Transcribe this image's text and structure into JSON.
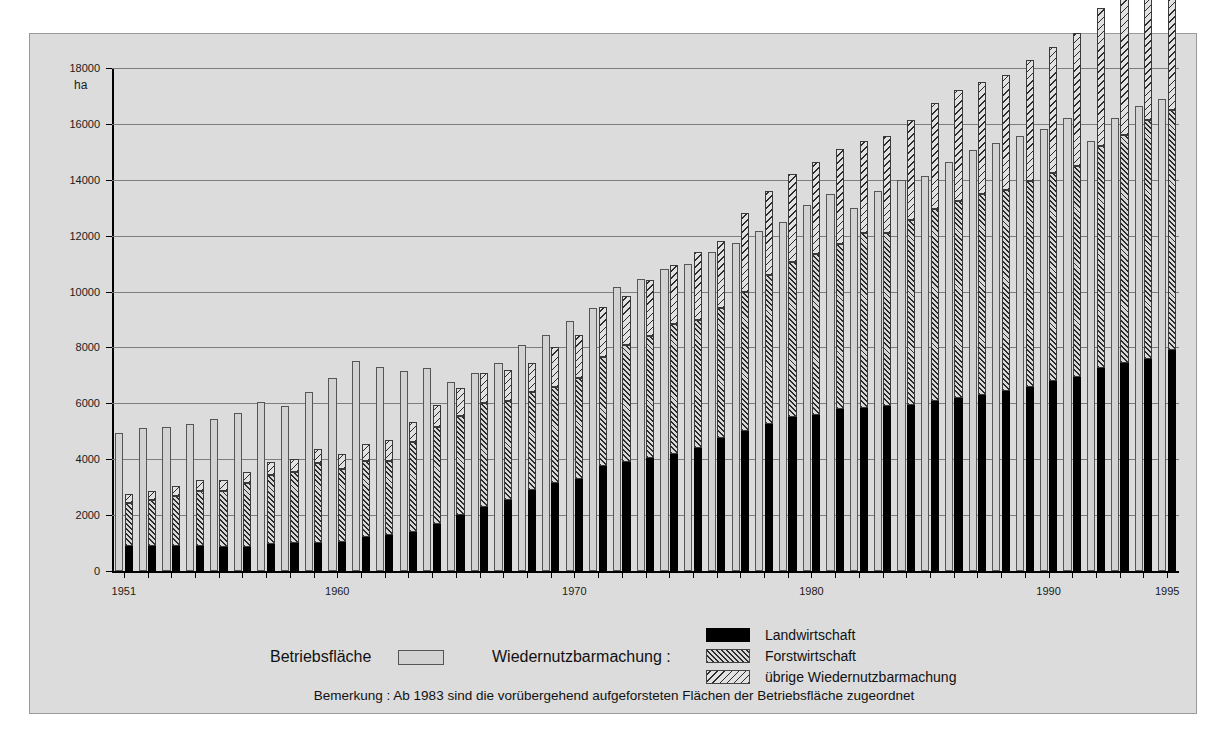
{
  "panel": {
    "y_axis_unit": "ha",
    "note": "Bemerkung : Ab  1983  sind die vorübergehend aufgeforsteten Flächen der Betriebsfläche zugeordnet"
  },
  "legend": {
    "betriebsflaeche_label": "Betriebsfläche",
    "wiedernutzbarmachung_label": "Wiedernutzbarmachung :",
    "items": [
      {
        "label": "Landwirtschaft",
        "pattern": "solid-black",
        "color": "#000000"
      },
      {
        "label": "Forstwirtschaft",
        "pattern": "dense-diagonal-hatch",
        "color": "#2b2b2b"
      },
      {
        "label": "übrige Wiedernutzbarmachung",
        "pattern": "sparse-reverse-diagonal-hatch",
        "color": "#2b2b2b"
      }
    ]
  },
  "chart_data": {
    "type": "bar",
    "title": "",
    "subtitle": "",
    "xlabel": "",
    "ylabel": "ha",
    "ylim": [
      0,
      18000
    ],
    "ytick_values": [
      0,
      2000,
      4000,
      6000,
      8000,
      10000,
      12000,
      14000,
      16000,
      18000
    ],
    "ytick_labels": [
      "0",
      "2000",
      "4000",
      "6000",
      "8000",
      "10000",
      "12000",
      "14000",
      "16000",
      "18000"
    ],
    "grid": true,
    "legend_position": "bottom",
    "xtick_labels": [
      "1951",
      "1960",
      "1970",
      "1980",
      "1990",
      "1995"
    ],
    "xtick_years": [
      1951,
      1960,
      1970,
      1980,
      1990,
      1995
    ],
    "categories": [
      1951,
      1952,
      1953,
      1954,
      1955,
      1956,
      1957,
      1958,
      1959,
      1960,
      1961,
      1962,
      1963,
      1964,
      1965,
      1966,
      1967,
      1968,
      1969,
      1970,
      1971,
      1972,
      1973,
      1974,
      1975,
      1976,
      1977,
      1978,
      1979,
      1980,
      1981,
      1982,
      1983,
      1984,
      1985,
      1986,
      1987,
      1988,
      1989,
      1990,
      1991,
      1992,
      1993,
      1994,
      1995
    ],
    "series": [
      {
        "name": "Betriebsfläche",
        "stack": "betrieb",
        "pattern": "outline-light",
        "values": [
          4950,
          5100,
          5150,
          5250,
          5450,
          5650,
          6050,
          5900,
          6400,
          6900,
          7500,
          7300,
          7150,
          7250,
          6750,
          7100,
          7450,
          8100,
          8450,
          8950,
          9400,
          10150,
          10450,
          10800,
          11000,
          11400,
          11750,
          12150,
          12500,
          13100,
          13500,
          13000,
          13600,
          14000,
          14150,
          14650,
          15050,
          15300,
          15550,
          15800,
          16200,
          15400,
          16200,
          16650,
          16900
        ]
      },
      {
        "name": "Landwirtschaft",
        "stack": "wieder",
        "pattern": "solid-black",
        "values": [
          900,
          900,
          900,
          900,
          850,
          850,
          950,
          1000,
          1000,
          1050,
          1200,
          1300,
          1400,
          1700,
          2000,
          2300,
          2550,
          2900,
          3150,
          3300,
          3750,
          3900,
          4050,
          4200,
          4400,
          4750,
          5000,
          5250,
          5500,
          5600,
          5800,
          5850,
          5900,
          5950,
          6100,
          6200,
          6300,
          6450,
          6600,
          6800,
          6950,
          7250,
          7450,
          7600,
          7900
        ]
      },
      {
        "name": "Forstwirtschaft",
        "stack": "wieder",
        "pattern": "dense-diagonal-hatch",
        "values": [
          1550,
          1650,
          1800,
          1950,
          2000,
          2300,
          2500,
          2550,
          2850,
          2600,
          2750,
          2650,
          3200,
          3450,
          3550,
          3700,
          3550,
          3500,
          3450,
          3600,
          3900,
          4200,
          4350,
          4650,
          4600,
          4650,
          5000,
          5350,
          5550,
          5750,
          5900,
          6250,
          6200,
          6600,
          6850,
          7050,
          7200,
          7200,
          7350,
          7450,
          7550,
          7950,
          8150,
          8550,
          8600
        ]
      },
      {
        "name": "übrige Wiedernutzbarmachung",
        "stack": "wieder",
        "pattern": "sparse-reverse-diagonal-hatch",
        "values": [
          300,
          300,
          350,
          400,
          400,
          400,
          450,
          450,
          500,
          550,
          600,
          750,
          750,
          800,
          1000,
          1100,
          1100,
          1050,
          1400,
          1550,
          1800,
          1750,
          2000,
          2100,
          2400,
          2400,
          2800,
          3000,
          3150,
          3300,
          3400,
          3300,
          3450,
          3600,
          3800,
          3950,
          4000,
          4100,
          4350,
          4500,
          4750,
          4950,
          5150,
          5400,
          5500
        ]
      }
    ]
  }
}
